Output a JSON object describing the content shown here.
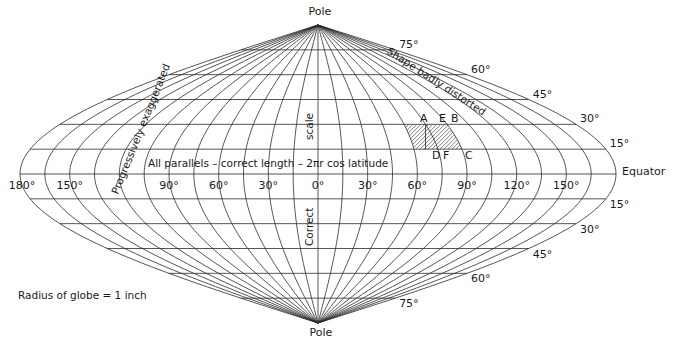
{
  "figure": {
    "type": "sinusoidal-projection",
    "colors": {
      "ink": "#2a2a2a",
      "text": "#1a1a1a",
      "background": "#ffffff"
    },
    "geometry": {
      "cx": 318,
      "cy": 174,
      "half_width": 298,
      "half_height": 149,
      "step_deg": 15
    },
    "pole_labels": {
      "top": "Pole",
      "bottom": "Pole"
    },
    "equator_label": "Equator",
    "meridian_labels": [
      {
        "text": "180°",
        "lon": -180
      },
      {
        "text": "150°",
        "lon": -150
      },
      {
        "text": "90°",
        "lon": -90
      },
      {
        "text": "60°",
        "lon": -60
      },
      {
        "text": "30°",
        "lon": -30
      },
      {
        "text": "0°",
        "lon": 0
      },
      {
        "text": "30°",
        "lon": 30
      },
      {
        "text": "60°",
        "lon": 60
      },
      {
        "text": "90°",
        "lon": 90
      },
      {
        "text": "120°",
        "lon": 120
      },
      {
        "text": "150°",
        "lon": 150
      }
    ],
    "parallel_labels_north": [
      {
        "text": "15°",
        "lat": 15
      },
      {
        "text": "30°",
        "lat": 30
      },
      {
        "text": "45°",
        "lat": 45
      },
      {
        "text": "60°",
        "lat": 60
      },
      {
        "text": "75°",
        "lat": 75
      }
    ],
    "parallel_labels_south": [
      {
        "text": "15°",
        "lat": -15
      },
      {
        "text": "30°",
        "lat": -30
      },
      {
        "text": "45°",
        "lat": -45
      },
      {
        "text": "60°",
        "lat": -60
      },
      {
        "text": "75°",
        "lat": -75
      }
    ],
    "annotations": {
      "parallels": "All parallels – correct length – 2πr cos latitude",
      "scale_top": "scale",
      "scale_bottom": "Correct",
      "progressive": "Progressively exaggerated",
      "shape": "Shape badly distorted",
      "radius": "Radius of globe = 1 inch"
    },
    "hatched_region": {
      "lon_from": 60,
      "lon_to": 90,
      "lat_from": 15,
      "lat_to": 30,
      "points": {
        "A": "A",
        "E": "E",
        "B": "B",
        "D": "D",
        "F": "F",
        "C": "C"
      }
    }
  }
}
